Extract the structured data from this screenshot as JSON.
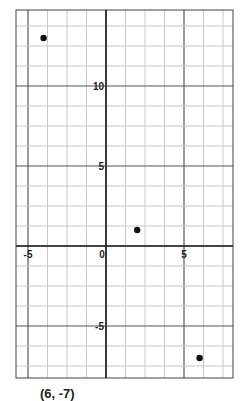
{
  "chart_data": {
    "type": "scatter",
    "title": "",
    "xlabel": "",
    "ylabel": "",
    "xlim": [
      -5.75,
      8.25
    ],
    "ylim": [
      -8.25,
      14.75
    ],
    "grid": true,
    "grid_step": 1.25,
    "x_ticks": [
      -5,
      0,
      5
    ],
    "y_ticks": [
      10,
      5,
      -5
    ],
    "x_tick_labels": [
      "-5",
      "0",
      "5"
    ],
    "y_tick_labels": [
      "10",
      "5",
      "-5"
    ],
    "points": [
      {
        "x": -4,
        "y": 13
      },
      {
        "x": 2,
        "y": 1
      },
      {
        "x": 6,
        "y": -7
      }
    ],
    "caption": "(6, -7)"
  }
}
